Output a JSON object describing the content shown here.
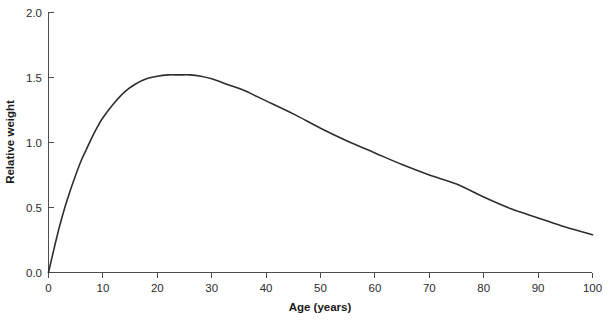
{
  "chart_data": {
    "type": "line",
    "title": "",
    "xlabel": "Age (years)",
    "ylabel": "Relative weight",
    "xlim": [
      0,
      100
    ],
    "ylim": [
      0.0,
      2.0
    ],
    "xticks": [
      0,
      10,
      20,
      30,
      40,
      50,
      60,
      70,
      80,
      90,
      100
    ],
    "xticklabels": [
      "0",
      "10",
      "20",
      "30",
      "40",
      "50",
      "60",
      "70",
      "80",
      "90",
      "100"
    ],
    "yticks": [
      0.0,
      0.5,
      1.0,
      1.5,
      2.0
    ],
    "yticklabels": [
      "0.0",
      "0.5",
      "1.0",
      "1.5",
      "2.0"
    ],
    "grid": false,
    "legend": null,
    "line_color": "#2e2e2e",
    "axis_color": "#4d4d4d",
    "background_color": "#ffffff",
    "series": [
      {
        "name": "relative weight",
        "x": [
          0,
          1,
          2,
          3,
          4,
          5,
          6,
          7,
          8,
          9,
          10,
          12,
          14,
          16,
          18,
          20,
          22,
          24,
          26,
          28,
          30,
          32,
          34,
          36,
          38,
          40,
          45,
          50,
          55,
          60,
          65,
          70,
          75,
          80,
          85,
          90,
          95,
          100
        ],
        "y": [
          0.0,
          0.18,
          0.35,
          0.5,
          0.63,
          0.75,
          0.86,
          0.95,
          1.04,
          1.12,
          1.19,
          1.3,
          1.39,
          1.45,
          1.49,
          1.51,
          1.52,
          1.52,
          1.52,
          1.51,
          1.49,
          1.46,
          1.43,
          1.4,
          1.36,
          1.32,
          1.22,
          1.11,
          1.01,
          0.92,
          0.83,
          0.75,
          0.68,
          0.58,
          0.49,
          0.42,
          0.35,
          0.29
        ]
      }
    ],
    "annotations": [
      {
        "label": "peak",
        "x": 25,
        "y": 1.52
      }
    ]
  }
}
